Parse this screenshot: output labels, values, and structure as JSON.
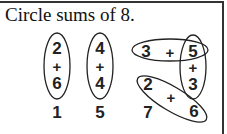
{
  "title": "Circle sums of 8.",
  "problems": [
    {
      "label": "1",
      "top": "2",
      "op": "+",
      "bottom": "6",
      "circled": true
    },
    {
      "label": "5",
      "top": "4",
      "op": "+",
      "bottom": "4",
      "circled": true
    },
    {
      "label": "7",
      "grid": {
        "a": "3",
        "op_ab": "+",
        "b": "5",
        "op_bc": "+",
        "c": "3",
        "d": "2",
        "op_de": "+",
        "e": "6"
      },
      "circled_pairs": [
        "3 + 5",
        "5 + 3",
        "2 + 6"
      ]
    }
  ],
  "colors": {
    "ink": "#222222",
    "border": "#333333",
    "background": "#ffffff"
  }
}
